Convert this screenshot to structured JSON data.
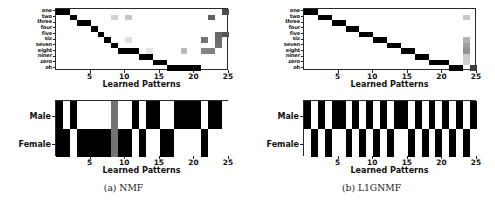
{
  "figure": {
    "panels": [
      {
        "caption": "(a) NMF",
        "id": "nmf"
      },
      {
        "caption": "(b) L1GNMF",
        "id": "l1gnmf"
      }
    ],
    "axis_title": "Learned Patterns",
    "x_ticks": [
      5,
      10,
      15,
      20,
      25
    ],
    "digit_labels": [
      "one",
      "two",
      "three",
      "four",
      "five",
      "six",
      "seven",
      "eight",
      "niner",
      "zero",
      "oh"
    ],
    "gender_labels": [
      "Male",
      "Female"
    ],
    "colors": {
      "ink": "#111111",
      "cell_on": "#000000",
      "cell_off": "#ffffff",
      "axis": "#2a2a2a"
    }
  },
  "chart_data": [
    {
      "type": "heatmap",
      "title": "(a) NMF",
      "subplot": "digit-by-pattern",
      "xlabel": "Learned Patterns",
      "ylabel": "",
      "xlim": [
        0,
        25
      ],
      "x_tick_labels": [
        "5",
        "10",
        "15",
        "20",
        "25"
      ],
      "y_tick_labels": [
        "one",
        "two",
        "three",
        "four",
        "five",
        "six",
        "seven",
        "eight",
        "niner",
        "zero",
        "oh"
      ],
      "colormap": "grayscale_inverted",
      "value_range": [
        0,
        1
      ],
      "grid": false,
      "cells": [
        {
          "x": 1,
          "y": "one",
          "v": 1.0
        },
        {
          "x": 2,
          "y": "one",
          "v": 1.0
        },
        {
          "x": 3,
          "y": "two",
          "v": 1.0
        },
        {
          "x": 4,
          "y": "three",
          "v": 1.0
        },
        {
          "x": 5,
          "y": "three",
          "v": 1.0
        },
        {
          "x": 6,
          "y": "four",
          "v": 1.0
        },
        {
          "x": 7,
          "y": "five",
          "v": 1.0
        },
        {
          "x": 8,
          "y": "six",
          "v": 1.0
        },
        {
          "x": 9,
          "y": "seven",
          "v": 1.0
        },
        {
          "x": 10,
          "y": "eight",
          "v": 1.0
        },
        {
          "x": 11,
          "y": "eight",
          "v": 1.0
        },
        {
          "x": 12,
          "y": "eight",
          "v": 1.0
        },
        {
          "x": 13,
          "y": "niner",
          "v": 1.0
        },
        {
          "x": 14,
          "y": "niner",
          "v": 1.0
        },
        {
          "x": 15,
          "y": "zero",
          "v": 1.0
        },
        {
          "x": 16,
          "y": "zero",
          "v": 1.0
        },
        {
          "x": 17,
          "y": "oh",
          "v": 1.0
        },
        {
          "x": 18,
          "y": "oh",
          "v": 1.0
        },
        {
          "x": 19,
          "y": "oh",
          "v": 1.0
        },
        {
          "x": 20,
          "y": "oh",
          "v": 1.0
        },
        {
          "x": 21,
          "y": "oh",
          "v": 1.0
        },
        {
          "x": 9,
          "y": "two",
          "v": 0.18
        },
        {
          "x": 11,
          "y": "two",
          "v": 0.22
        },
        {
          "x": 11,
          "y": "six",
          "v": 0.12
        },
        {
          "x": 14,
          "y": "eight",
          "v": 0.1
        },
        {
          "x": 19,
          "y": "eight",
          "v": 0.28
        },
        {
          "x": 22,
          "y": "six",
          "v": 0.55
        },
        {
          "x": 22,
          "y": "eight",
          "v": 0.48
        },
        {
          "x": 23,
          "y": "two",
          "v": 0.62
        },
        {
          "x": 23,
          "y": "eight",
          "v": 0.5
        },
        {
          "x": 24,
          "y": "five",
          "v": 0.6
        },
        {
          "x": 24,
          "y": "six",
          "v": 0.58
        },
        {
          "x": 24,
          "y": "seven",
          "v": 0.55
        },
        {
          "x": 25,
          "y": "one",
          "v": 0.7
        },
        {
          "x": 25,
          "y": "five",
          "v": 0.66
        }
      ]
    },
    {
      "type": "heatmap",
      "title": "(a) NMF - gender",
      "subplot": "gender-by-pattern",
      "xlabel": "Learned Patterns",
      "xlim": [
        0,
        25
      ],
      "x_tick_labels": [
        "5",
        "10",
        "15",
        "20",
        "25"
      ],
      "y_tick_labels": [
        "Male",
        "Female"
      ],
      "colormap": "grayscale_inverted",
      "value_range": [
        0,
        1
      ],
      "male": [
        1,
        0,
        1,
        0,
        0,
        0,
        0,
        0,
        0.55,
        0,
        0,
        1,
        0,
        1,
        1,
        0,
        0,
        1,
        1,
        1,
        1,
        0,
        1,
        1,
        0
      ],
      "female": [
        1,
        1,
        0,
        1,
        1,
        1,
        1,
        1,
        0.55,
        1,
        1,
        0,
        1,
        0,
        0,
        1,
        1,
        0,
        0,
        0,
        0,
        1,
        0,
        0,
        0
      ]
    },
    {
      "type": "heatmap",
      "title": "(b) L1GNMF",
      "subplot": "digit-by-pattern",
      "xlabel": "Learned Patterns",
      "xlim": [
        0,
        25
      ],
      "x_tick_labels": [
        "5",
        "10",
        "15",
        "20",
        "25"
      ],
      "y_tick_labels": [
        "one",
        "two",
        "three",
        "four",
        "five",
        "six",
        "seven",
        "eight",
        "niner",
        "zero",
        "oh"
      ],
      "colormap": "grayscale_inverted",
      "value_range": [
        0,
        1
      ],
      "cells": [
        {
          "x": 1,
          "y": "one",
          "v": 1.0
        },
        {
          "x": 2,
          "y": "one",
          "v": 1.0
        },
        {
          "x": 3,
          "y": "two",
          "v": 1.0
        },
        {
          "x": 4,
          "y": "two",
          "v": 1.0
        },
        {
          "x": 5,
          "y": "three",
          "v": 1.0
        },
        {
          "x": 6,
          "y": "three",
          "v": 1.0
        },
        {
          "x": 7,
          "y": "four",
          "v": 1.0
        },
        {
          "x": 8,
          "y": "four",
          "v": 1.0
        },
        {
          "x": 9,
          "y": "five",
          "v": 1.0
        },
        {
          "x": 10,
          "y": "five",
          "v": 1.0
        },
        {
          "x": 11,
          "y": "six",
          "v": 1.0
        },
        {
          "x": 12,
          "y": "six",
          "v": 1.0
        },
        {
          "x": 13,
          "y": "seven",
          "v": 1.0
        },
        {
          "x": 14,
          "y": "seven",
          "v": 1.0
        },
        {
          "x": 15,
          "y": "eight",
          "v": 1.0
        },
        {
          "x": 16,
          "y": "eight",
          "v": 1.0
        },
        {
          "x": 17,
          "y": "niner",
          "v": 1.0
        },
        {
          "x": 18,
          "y": "niner",
          "v": 1.0
        },
        {
          "x": 19,
          "y": "zero",
          "v": 1.0
        },
        {
          "x": 20,
          "y": "zero",
          "v": 1.0
        },
        {
          "x": 21,
          "y": "zero",
          "v": 1.0
        },
        {
          "x": 22,
          "y": "oh",
          "v": 1.0
        },
        {
          "x": 23,
          "y": "oh",
          "v": 1.0
        },
        {
          "x": 24,
          "y": "two",
          "v": 0.22
        },
        {
          "x": 24,
          "y": "six",
          "v": 0.3
        },
        {
          "x": 24,
          "y": "seven",
          "v": 0.38
        },
        {
          "x": 24,
          "y": "eight",
          "v": 0.42
        },
        {
          "x": 24,
          "y": "niner",
          "v": 0.2
        },
        {
          "x": 24,
          "y": "zero",
          "v": 0.18
        },
        {
          "x": 25,
          "y": "oh",
          "v": 0.75
        }
      ]
    },
    {
      "type": "heatmap",
      "title": "(b) L1GNMF - gender",
      "subplot": "gender-by-pattern",
      "xlabel": "Learned Patterns",
      "xlim": [
        0,
        25
      ],
      "x_tick_labels": [
        "5",
        "10",
        "15",
        "20",
        "25"
      ],
      "y_tick_labels": [
        "Male",
        "Female"
      ],
      "colormap": "grayscale_inverted",
      "value_range": [
        0,
        1
      ],
      "male": [
        1,
        0,
        1,
        0,
        1,
        1,
        0,
        1,
        0,
        1,
        0,
        1,
        0,
        1,
        1,
        0,
        1,
        0,
        1,
        0,
        1,
        0,
        1,
        0,
        1
      ],
      "female": [
        0,
        1,
        0,
        1,
        0,
        0,
        1,
        0,
        1,
        0,
        1,
        0,
        1,
        0,
        0,
        1,
        0,
        1,
        0,
        1,
        0,
        1,
        0,
        1,
        0
      ]
    }
  ]
}
